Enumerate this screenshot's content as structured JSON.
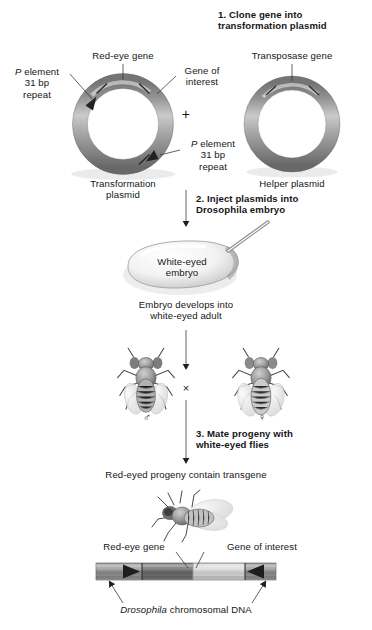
{
  "figure": {
    "steps": [
      {
        "num": "1.",
        "text": "1. Clone gene into\ntransformation plasmid"
      },
      {
        "num": "2.",
        "text": "2. Inject plasmids into\nDrosophila embryo"
      },
      {
        "num": "3.",
        "text": "3. Mate progeny with\nwhite-eyed flies"
      }
    ],
    "plasmids": {
      "transformation": {
        "caption": "Transformation\nplasmid",
        "labels": {
          "red_eye_gene": "Red-eye gene",
          "gene_of_interest": "Gene of\ninterest",
          "p_element_left_italic": "P",
          "p_element_left_rest": " element\n31 bp\nrepeat",
          "p_element_right_italic": "P",
          "p_element_right_rest": " element\n31 bp\nrepeat"
        }
      },
      "helper": {
        "caption": "Helper plasmid",
        "labels": {
          "transposase_gene": "Transposase gene"
        }
      },
      "operator": "+"
    },
    "embryo": {
      "label": "White-eyed\nembryo",
      "develops_text": "Embryo develops into\nwhite-eyed adult"
    },
    "cross": {
      "symbol": "×",
      "male_symbol": "♂",
      "female_symbol": "♀"
    },
    "progeny": {
      "caption": "Red-eyed progeny contain transgene"
    },
    "chromosome": {
      "label_left": "Red-eye gene",
      "label_right": "Gene of interest",
      "caption_italic": "Drosophila",
      "caption_rest": " chromosomal DNA"
    },
    "colors": {
      "ink": "#161616",
      "line": "#3a3a3a",
      "plasmid_dark": "#6b6b6b",
      "plasmid_light": "#d8d8d8",
      "dna_dark": "#5a5a5a",
      "dna_light": "#d2d2d2"
    }
  }
}
